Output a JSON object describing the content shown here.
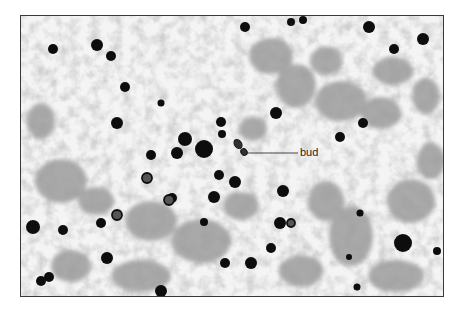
{
  "figure": {
    "annotation": {
      "label": "bud",
      "pointer_from": [
        297,
        152
      ],
      "pointer_to": [
        246,
        152
      ]
    },
    "colors": {
      "frame": "#3a3a3a",
      "background": "#f2f2f2",
      "cell": "#0a0a0a",
      "debris": "#9a9a9a"
    },
    "cells": [
      [
        52,
        48,
        5
      ],
      [
        96,
        44,
        6
      ],
      [
        110,
        55,
        5
      ],
      [
        124,
        86,
        5
      ],
      [
        116,
        122,
        6
      ],
      [
        160,
        102,
        3.5
      ],
      [
        184,
        138,
        7
      ],
      [
        203,
        148,
        9
      ],
      [
        176,
        152,
        6
      ],
      [
        150,
        154,
        5
      ],
      [
        244,
        26,
        5
      ],
      [
        290,
        21,
        4
      ],
      [
        302,
        19,
        4
      ],
      [
        368,
        26,
        6
      ],
      [
        422,
        38,
        6
      ],
      [
        393,
        48,
        5
      ],
      [
        275,
        112,
        6
      ],
      [
        362,
        122,
        5
      ],
      [
        339,
        136,
        5
      ],
      [
        220,
        121,
        5
      ],
      [
        221,
        133,
        4
      ],
      [
        218,
        174,
        5
      ],
      [
        213,
        196,
        6
      ],
      [
        234,
        181,
        6
      ],
      [
        282,
        190,
        6
      ],
      [
        279,
        222,
        6
      ],
      [
        32,
        226,
        7
      ],
      [
        62,
        229,
        5
      ],
      [
        100,
        222,
        5
      ],
      [
        116,
        214,
        4
      ],
      [
        106,
        257,
        6
      ],
      [
        40,
        280,
        5
      ],
      [
        48,
        276,
        5
      ],
      [
        160,
        290,
        6
      ],
      [
        250,
        262,
        6
      ],
      [
        224,
        262,
        5
      ],
      [
        359,
        212,
        3.5
      ],
      [
        402,
        242,
        9
      ],
      [
        270,
        247,
        5
      ],
      [
        171,
        197,
        5
      ],
      [
        203,
        221,
        4
      ],
      [
        436,
        250,
        4
      ],
      [
        348,
        256,
        3
      ],
      [
        356,
        286,
        3.5
      ]
    ],
    "rings": [
      [
        168,
        199,
        5
      ],
      [
        116,
        214,
        5
      ],
      [
        146,
        177,
        5
      ],
      [
        290,
        222,
        4
      ]
    ],
    "bud": {
      "mother": [
        237,
        143,
        3.5,
        5
      ],
      "daughter": [
        243,
        151,
        3,
        3.5
      ]
    }
  }
}
